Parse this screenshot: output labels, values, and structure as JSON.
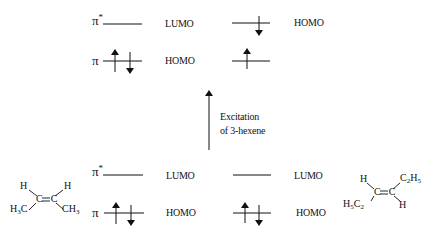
{
  "top": {
    "left": {
      "pistar_label": "π",
      "pistar_sup": "*",
      "pistar_role": "LUMO",
      "pi_label": "π",
      "pi_role": "HOMO",
      "pi_electrons": "↑↓"
    },
    "right": {
      "upper_role": "HOMO",
      "upper_electrons": "↓",
      "lower_electrons": "↑"
    }
  },
  "arrow": {
    "label_line1": "Excitation",
    "label_line2": "of 3-hexene"
  },
  "bottom": {
    "left": {
      "pistar_label": "π",
      "pistar_sup": "*",
      "pistar_role": "LUMO",
      "pi_label": "π",
      "pi_role": "HOMO",
      "pi_electrons": "↑↓"
    },
    "right": {
      "upper_role": "LUMO",
      "lower_role": "HOMO",
      "lower_electrons": "↑↓"
    }
  },
  "molecules": {
    "cis": {
      "name": "cis-2-butene",
      "h_left": "H",
      "h_right": "H",
      "cc": "C=C",
      "left_group": "H3C",
      "right_group": "CH3"
    },
    "trans": {
      "name": "trans-3-hexene",
      "h_top": "H",
      "h_bottom": "H",
      "cc": "C=C",
      "top_group": "C2H5",
      "bottom_group": "H5C2"
    }
  }
}
